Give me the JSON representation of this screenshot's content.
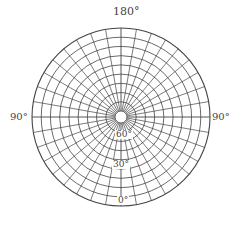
{
  "diagram": {
    "type": "polar-net",
    "center": [
      121,
      117
    ],
    "outer_radius": 89,
    "inner_radius": 6,
    "ring_count": 9,
    "spoke_step_deg": 10,
    "line_color": "#444444",
    "background": "#ffffff"
  },
  "labels": {
    "top": "180°",
    "left": "90°",
    "right": "90°",
    "inner_60": "60°",
    "inner_30": "30°",
    "bottom": "0°"
  }
}
